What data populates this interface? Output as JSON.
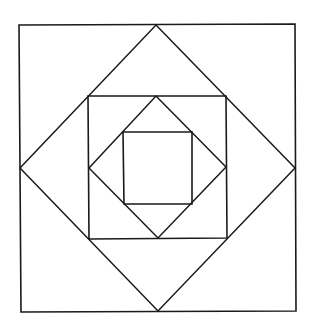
{
  "diagram": {
    "stroke_color": "#1a1a1a",
    "background": "#ffffff",
    "shapes": {
      "outer_square": {
        "points": "19,25 295,24 296,311 21,312"
      },
      "outer_diamond": {
        "points": "156,25 295,168 158,311 20,168"
      },
      "middle_square": {
        "points": "88,96 226,96 227,238 89,239"
      },
      "middle_diamond": {
        "points": "156,96 226,167 158,238 89,168"
      },
      "inner_square": {
        "points": "123,132 192,132 192,204 124,204"
      }
    }
  }
}
